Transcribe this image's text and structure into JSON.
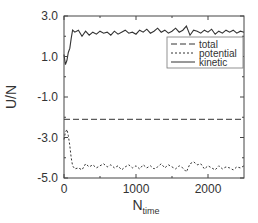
{
  "chart_data": {
    "type": "line",
    "title": "",
    "xlabel": "N",
    "xlabel_subscript": "time",
    "ylabel": "U/N",
    "xlim": [
      0,
      2500
    ],
    "ylim": [
      -5.0,
      3.0
    ],
    "xticks": [
      0,
      1000,
      2000
    ],
    "xtick_labels": [
      "0",
      "1000",
      "2000"
    ],
    "xminor_ticks": [
      500,
      1500
    ],
    "yticks": [
      3.0,
      1.0,
      -1.0,
      -3.0,
      -5.0
    ],
    "ytick_labels": [
      "3.0",
      "1.0",
      "-1.0",
      "-3.0",
      "-5.0"
    ],
    "yminor_ticks": [
      2.0,
      0.0,
      -2.0,
      -4.0
    ],
    "grid": false,
    "legend_position": "upper right",
    "series": [
      {
        "name": "total",
        "style": "dashed",
        "x": [
          0,
          2500
        ],
        "y": [
          -2.1,
          -2.1
        ]
      },
      {
        "name": "potential",
        "style": "dotted",
        "x": [
          0,
          20,
          40,
          60,
          80,
          100,
          120,
          150,
          200,
          250,
          300,
          350,
          400,
          450,
          500,
          550,
          600,
          650,
          700,
          750,
          800,
          850,
          900,
          950,
          1000,
          1050,
          1100,
          1150,
          1200,
          1250,
          1300,
          1350,
          1400,
          1450,
          1500,
          1550,
          1600,
          1650,
          1700,
          1750,
          1800,
          1850,
          1900,
          1950,
          2000,
          2050,
          2100,
          2150,
          2200,
          2250,
          2300,
          2350,
          2400,
          2450,
          2500
        ],
        "y": [
          -3.1,
          -2.75,
          -2.6,
          -2.9,
          -3.4,
          -4.0,
          -4.4,
          -4.55,
          -4.5,
          -4.6,
          -4.3,
          -4.45,
          -4.35,
          -4.5,
          -4.4,
          -4.3,
          -4.45,
          -4.35,
          -4.5,
          -4.4,
          -4.6,
          -4.45,
          -4.35,
          -4.5,
          -4.4,
          -4.55,
          -4.35,
          -4.5,
          -4.4,
          -4.55,
          -4.45,
          -4.3,
          -4.5,
          -4.35,
          -4.45,
          -4.55,
          -4.4,
          -4.5,
          -4.7,
          -4.3,
          -4.2,
          -4.35,
          -4.3,
          -4.55,
          -4.4,
          -4.5,
          -4.6,
          -4.4,
          -4.55,
          -4.45,
          -4.5,
          -4.6,
          -4.45,
          -4.5,
          -4.4
        ]
      },
      {
        "name": "kinetic",
        "style": "solid",
        "x": [
          0,
          20,
          40,
          60,
          80,
          100,
          120,
          150,
          200,
          250,
          300,
          350,
          400,
          450,
          500,
          550,
          600,
          650,
          700,
          750,
          800,
          850,
          900,
          950,
          1000,
          1050,
          1100,
          1150,
          1200,
          1250,
          1300,
          1350,
          1400,
          1450,
          1500,
          1550,
          1600,
          1650,
          1700,
          1750,
          1800,
          1850,
          1900,
          1950,
          2000,
          2050,
          2100,
          2150,
          2200,
          2250,
          2300,
          2350,
          2400,
          2450,
          2500
        ],
        "y": [
          1.1,
          0.6,
          0.8,
          1.2,
          1.4,
          1.9,
          2.3,
          2.2,
          2.3,
          2.0,
          2.25,
          2.05,
          2.2,
          2.1,
          2.25,
          2.15,
          2.2,
          2.05,
          2.25,
          2.1,
          2.2,
          2.3,
          2.15,
          2.2,
          2.1,
          2.3,
          2.2,
          2.35,
          2.15,
          2.25,
          2.4,
          2.2,
          2.3,
          2.15,
          2.25,
          2.4,
          2.2,
          2.3,
          2.5,
          2.05,
          2.3,
          2.25,
          2.15,
          2.3,
          2.2,
          2.35,
          2.1,
          2.25,
          2.15,
          2.3,
          2.2,
          2.3,
          2.15,
          2.25,
          2.2
        ]
      }
    ]
  },
  "legend": {
    "items": [
      {
        "label": "total",
        "style": "dashed"
      },
      {
        "label": "potential",
        "style": "dotted"
      },
      {
        "label": "kinetic",
        "style": "solid"
      }
    ]
  },
  "colors": {
    "line": "#333333",
    "axis": "#444444",
    "background": "#ffffff"
  }
}
